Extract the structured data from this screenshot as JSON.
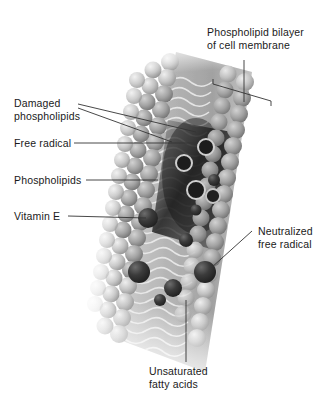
{
  "figure": {
    "title_visible": false,
    "background_color": "#ffffff",
    "style": "grayscale scientific illustration"
  },
  "labels": [
    {
      "id": "phospholipid-bilayer",
      "text": "Phospholipid bilayer\nof cell membrane",
      "position": "top-right",
      "leader": "vertical line down to a bracket spanning the bilayer thickness"
    },
    {
      "id": "damaged-phospholipids",
      "text": "Damaged\nphospholipids",
      "position": "left",
      "leader": "two diverging lines to two damaged regions"
    },
    {
      "id": "free-radical",
      "text": "Free radical",
      "position": "left",
      "leader": "horizontal line to ringed circle"
    },
    {
      "id": "phospholipids",
      "text": "Phospholipids",
      "position": "left",
      "leader": "horizontal line to head-group spheres"
    },
    {
      "id": "vitamin-e",
      "text": "Vitamin E",
      "position": "left",
      "leader": "horizontal line to dark sphere"
    },
    {
      "id": "neutralized-free-radical",
      "text": "Neutralized\nfree radical",
      "position": "right",
      "leader": "horizontal line to dark sphere inside bilayer"
    },
    {
      "id": "unsaturated-fatty-acids",
      "text": "Unsaturated\nfatty acids",
      "position": "bottom-center",
      "leader": "vertical line up into the tail region"
    }
  ],
  "colors": {
    "text": "#1a1a1a",
    "leader_line": "#333333",
    "background": "#ffffff",
    "head_light": "#c9c9c9",
    "head_mid": "#9a9a9a",
    "head_dark": "#5a5a5a",
    "radical_dark": "#3a3a3a",
    "tail_light": "#d8d8d8",
    "core_dark": "#2e2e2e"
  },
  "structure": {
    "bilayer_rows": 22,
    "heads_per_row": 7,
    "damaged_zone": "upper-right interior, darkened",
    "free_radical_count": 4,
    "vitamin_e_count": 3,
    "neutralized_radical_count": 3
  }
}
